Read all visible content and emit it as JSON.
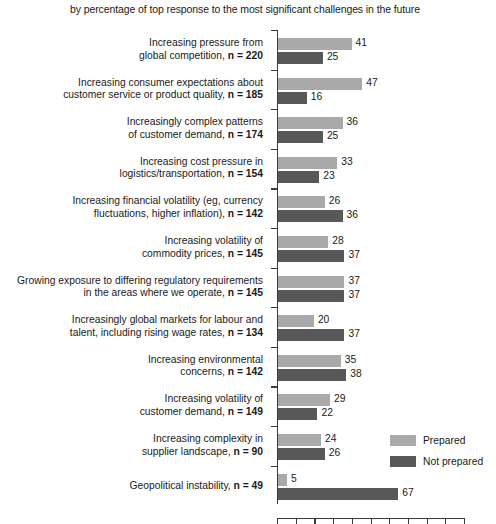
{
  "chart_data": {
    "type": "bar",
    "orientation": "horizontal",
    "title": "by percentage of top response to the most significant challenges in the future",
    "xlabel": "Percentage of respondents %",
    "ylabel": "",
    "xlim": [
      0,
      105
    ],
    "grid": false,
    "legend_position": "right-middle",
    "categories": [
      "Increasing pressure from global competition, n = 220",
      "Increasing consumer expectations about customer service or product quality, n = 185",
      "Increasingly complex patterns of customer demand, n = 174",
      "Increasing cost pressure in logistics/transportation, n = 154",
      "Increasing financial volatility (eg, currency fluctuations, higher inflation), n = 142",
      "Increasing volatility of commodity prices, n = 145",
      "Growing exposure to differing regulatory requirements in the areas where we operate, n = 145",
      "Increasingly global markets for labour and talent, including rising wage rates, n = 134",
      "Increasing environmental concerns, n = 142",
      "Increasing volatility of customer demand, n = 149",
      "Increasing complexity in supplier landscape, n = 90",
      "Geopolitical instability, n = 49"
    ],
    "series": [
      {
        "name": "Prepared",
        "color": "#a9a9a9",
        "values": [
          41,
          47,
          36,
          33,
          26,
          28,
          37,
          20,
          35,
          29,
          24,
          5
        ]
      },
      {
        "name": "Not prepared",
        "color": "#585858",
        "values": [
          25,
          16,
          25,
          23,
          36,
          37,
          37,
          37,
          38,
          22,
          26,
          67
        ]
      }
    ]
  },
  "category_lines": [
    [
      "Increasing pressure from",
      "global competition, ",
      "n = 220"
    ],
    [
      "Increasing consumer expectations about",
      "customer service or product quality, ",
      "n = 185"
    ],
    [
      "Increasingly complex patterns",
      "of customer demand, ",
      "n = 174"
    ],
    [
      "Increasing cost pressure in",
      "logistics/transportation, ",
      "n = 154"
    ],
    [
      "Increasing financial volatility (eg, currency",
      "fluctuations, higher inflation), ",
      "n = 142"
    ],
    [
      "Increasing volatility of",
      "commodity prices, ",
      "n = 145"
    ],
    [
      "Growing exposure to differing regulatory requirements",
      "in the areas where we operate, ",
      "n = 145"
    ],
    [
      "Increasingly global markets for labour and",
      "talent, including rising wage rates, ",
      "n = 134"
    ],
    [
      "Increasing environmental",
      "concerns, ",
      "n = 142"
    ],
    [
      "Increasing volatility of",
      "customer demand, ",
      "n = 149"
    ],
    [
      "Increasing complexity in",
      "supplier landscape, ",
      "n = 90"
    ],
    [
      "",
      "Geopolitical instability, ",
      "n = 49"
    ]
  ],
  "legend": {
    "items": [
      {
        "label": "Prepared",
        "color": "#a9a9a9"
      },
      {
        "label": "Not prepared",
        "color": "#585858"
      }
    ]
  },
  "axis": {
    "x_label": "Percentage of respondents %",
    "tick_count": 11
  }
}
